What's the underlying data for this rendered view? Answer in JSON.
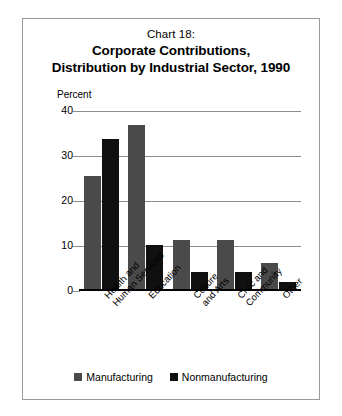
{
  "figure": {
    "title_line1": "Chart 18:",
    "title_line2": "Corporate Contributions,",
    "title_line3": "Distribution by Industrial Sector, 1990"
  },
  "chart_data": {
    "type": "bar",
    "title": "Chart 18: Corporate Contributions, Distribution by Industrial Sector, 1990",
    "xlabel": "",
    "ylabel": "Percent",
    "ylim": [
      0,
      40
    ],
    "yticks": [
      0,
      10,
      20,
      30,
      40
    ],
    "grid": true,
    "legend_position": "bottom",
    "categories": [
      "Health and\nHuman Services",
      "Education",
      "Culture\nand Arts",
      "Civic and\nCommunity",
      "Other"
    ],
    "series": [
      {
        "name": "Manufacturing",
        "color": "#4a4a4a",
        "values": [
          25.5,
          37.0,
          11.3,
          11.4,
          6.2
        ]
      },
      {
        "name": "Nonmanufacturing",
        "color": "#101010",
        "values": [
          33.7,
          10.2,
          4.2,
          4.3,
          2.1
        ]
      }
    ]
  }
}
